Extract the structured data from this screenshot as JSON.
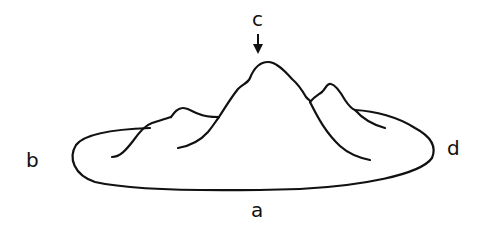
{
  "diagram": {
    "labels": {
      "a": "a",
      "b": "b",
      "c": "c",
      "d": "d"
    },
    "arrow": {
      "target": "c",
      "direction": "down"
    },
    "colors": {
      "stroke": "#111111",
      "background": "#ffffff"
    }
  }
}
